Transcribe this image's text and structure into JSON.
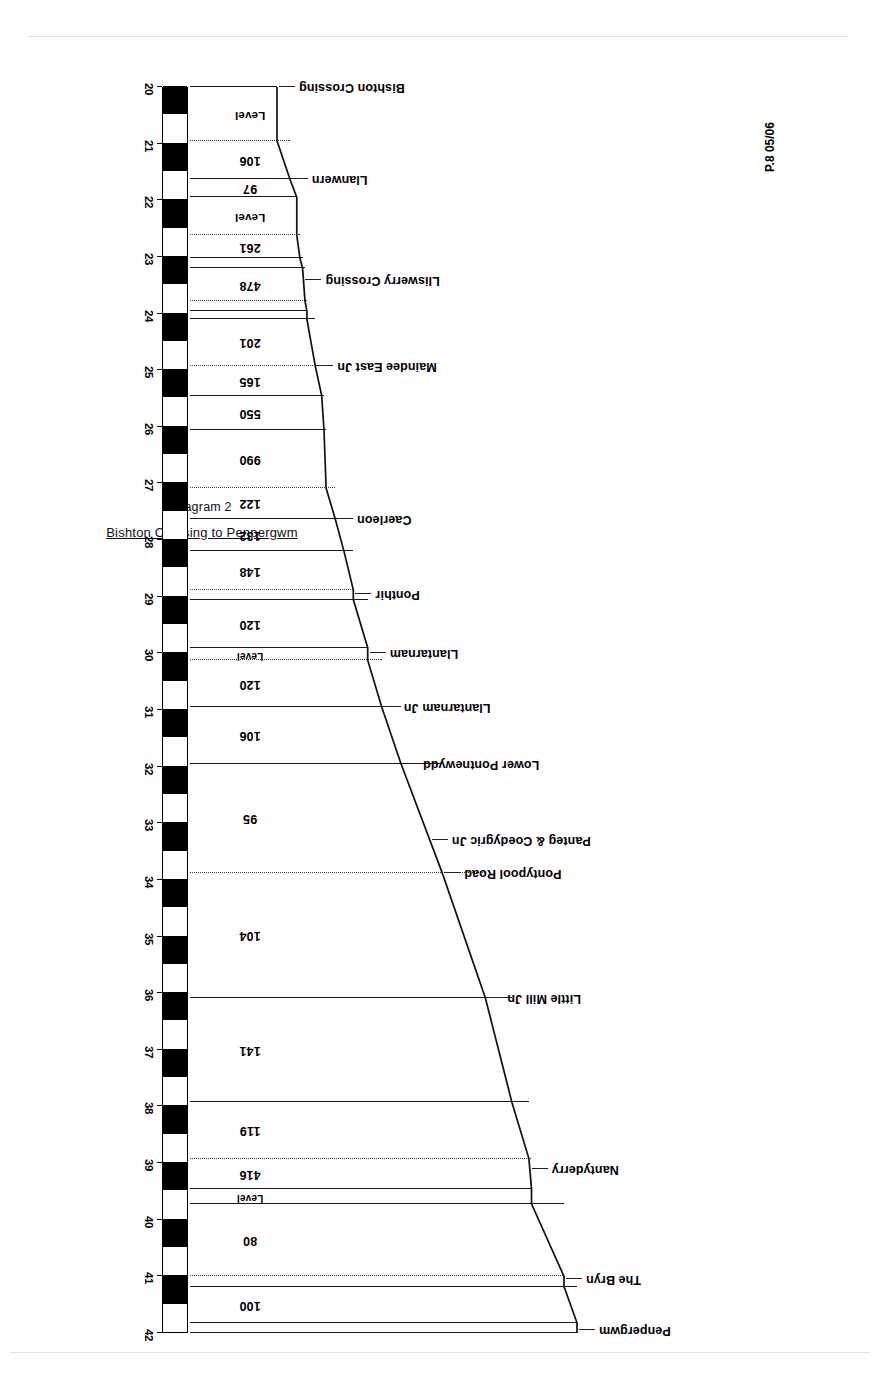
{
  "title_block": {
    "diagram_number": "Diagram 2",
    "diagram_title": "Bishton Crossing to Penpergwm"
  },
  "plate_reference": "P.8 05/06",
  "chart_data": {
    "type": "line",
    "title": "Bishton Crossing to Penpergwm",
    "subtitle": "Diagram 2",
    "xlabel": "Mileage",
    "ylabel": "Gradient profile",
    "xlim": [
      20,
      42
    ],
    "grid": false,
    "legend": "none",
    "axis_tick_labels": [
      "20",
      "21",
      "22",
      "23",
      "24",
      "25",
      "26",
      "27",
      "28",
      "29",
      "30",
      "31",
      "32",
      "33",
      "34",
      "35",
      "36",
      "37",
      "38",
      "39",
      "40",
      "41",
      "42"
    ],
    "gradient_sections": [
      {
        "from_mile": 20.0,
        "to_mile": 20.95,
        "gradient": "Level"
      },
      {
        "from_mile": 20.95,
        "to_mile": 21.62,
        "gradient": "106"
      },
      {
        "from_mile": 21.62,
        "to_mile": 21.95,
        "gradient": "97"
      },
      {
        "from_mile": 21.95,
        "to_mile": 22.62,
        "gradient": "Level"
      },
      {
        "from_mile": 22.62,
        "to_mile": 23.02,
        "gradient": "261"
      },
      {
        "from_mile": 23.02,
        "to_mile": 23.2,
        "gradient": "136"
      },
      {
        "from_mile": 23.2,
        "to_mile": 23.78,
        "gradient": "478"
      },
      {
        "from_mile": 23.78,
        "to_mile": 23.96,
        "gradient": "194"
      },
      {
        "from_mile": 23.96,
        "to_mile": 24.1,
        "gradient": "Level"
      },
      {
        "from_mile": 24.1,
        "to_mile": 24.92,
        "gradient": "201"
      },
      {
        "from_mile": 24.92,
        "to_mile": 25.45,
        "gradient": "165"
      },
      {
        "from_mile": 25.45,
        "to_mile": 26.05,
        "gradient": "550"
      },
      {
        "from_mile": 26.05,
        "to_mile": 27.08,
        "gradient": "990"
      },
      {
        "from_mile": 27.08,
        "to_mile": 27.62,
        "gradient": "122"
      },
      {
        "from_mile": 27.62,
        "to_mile": 28.2,
        "gradient": "132"
      },
      {
        "from_mile": 28.2,
        "to_mile": 28.88,
        "gradient": "148"
      },
      {
        "from_mile": 28.88,
        "to_mile": 29.05,
        "gradient": "Level"
      },
      {
        "from_mile": 29.05,
        "to_mile": 29.9,
        "gradient": "120"
      },
      {
        "from_mile": 29.9,
        "to_mile": 30.12,
        "gradient": "Level"
      },
      {
        "from_mile": 30.12,
        "to_mile": 30.95,
        "gradient": "120"
      },
      {
        "from_mile": 30.95,
        "to_mile": 31.95,
        "gradient": "106"
      },
      {
        "from_mile": 31.95,
        "to_mile": 33.88,
        "gradient": "95"
      },
      {
        "from_mile": 33.88,
        "to_mile": 36.08,
        "gradient": "104"
      },
      {
        "from_mile": 36.08,
        "to_mile": 37.92,
        "gradient": "141"
      },
      {
        "from_mile": 37.92,
        "to_mile": 38.92,
        "gradient": "119"
      },
      {
        "from_mile": 38.92,
        "to_mile": 39.45,
        "gradient": "416"
      },
      {
        "from_mile": 39.45,
        "to_mile": 39.72,
        "gradient": "Level"
      },
      {
        "from_mile": 39.72,
        "to_mile": 41.0,
        "gradient": "80"
      },
      {
        "from_mile": 41.0,
        "to_mile": 41.18,
        "gradient": "Level"
      },
      {
        "from_mile": 41.18,
        "to_mile": 41.82,
        "gradient": "100"
      },
      {
        "from_mile": 41.82,
        "to_mile": 42.0,
        "gradient": "Level"
      }
    ],
    "stations": [
      {
        "name": "Bishton Crossing",
        "mile": 20.0
      },
      {
        "name": "Llanwern",
        "mile": 21.62
      },
      {
        "name": "Lliswerry Crossing",
        "mile": 23.4
      },
      {
        "name": "Maindee East Jn",
        "mile": 24.92
      },
      {
        "name": "Caerleon",
        "mile": 27.62
      },
      {
        "name": "Ponthir",
        "mile": 28.96
      },
      {
        "name": "Llantarnam",
        "mile": 30.0
      },
      {
        "name": "Llantarnam Jn",
        "mile": 30.95
      },
      {
        "name": "Lower Pontnewydd",
        "mile": 31.95
      },
      {
        "name": "Panteg & Coedygric Jn",
        "mile": 33.3
      },
      {
        "name": "Pontypool Road",
        "mile": 33.88
      },
      {
        "name": "Little Mill Jn",
        "mile": 36.08
      },
      {
        "name": "Nantyderry",
        "mile": 39.1
      },
      {
        "name": "The Bryn",
        "mile": 41.05
      },
      {
        "name": "Penpergwm",
        "mile": 41.95
      }
    ]
  },
  "colors": {
    "ink": "#000000",
    "paper": "#ffffff",
    "scan_edge": "#c9c9c9"
  }
}
